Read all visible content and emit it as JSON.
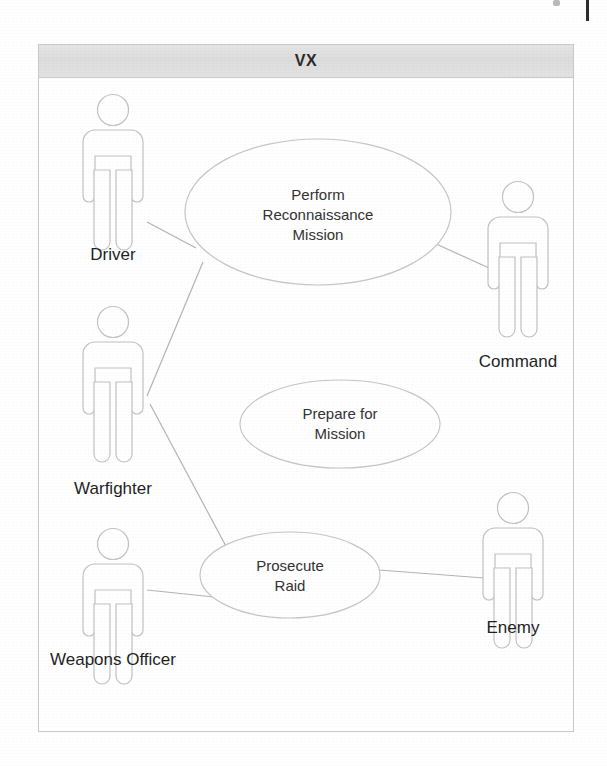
{
  "diagram": {
    "type": "uml-use-case-diagram",
    "system_boundary": {
      "title": "VX",
      "x": 38,
      "y": 44,
      "width": 536,
      "height": 688
    },
    "colors": {
      "stroke": "#bfbfbf",
      "actor_stroke": "#c4c4c4",
      "text": "#1f1f1f",
      "title_bar": "#e0e0e0",
      "boundary_border": "#c9c9c9",
      "background": "#ffffff"
    },
    "use_cases": [
      {
        "id": "perform-reconnaissance-mission",
        "label": "Perform\nReconnaissance\nMission",
        "cx": 318,
        "cy": 212,
        "rx": 133,
        "ry": 73
      },
      {
        "id": "prepare-for-mission",
        "label": "Prepare for\nMission",
        "cx": 340,
        "cy": 424,
        "rx": 100,
        "ry": 44
      },
      {
        "id": "prosecute-raid",
        "label": "Prosecute\nRaid",
        "cx": 290,
        "cy": 575,
        "rx": 90,
        "ry": 43
      }
    ],
    "actors": [
      {
        "id": "driver",
        "label": "Driver",
        "x": 113,
        "y": 100,
        "label_x": 113,
        "label_y": 245
      },
      {
        "id": "warfighter",
        "label": "Warfighter",
        "x": 113,
        "y": 312,
        "label_x": 113,
        "label_y": 479
      },
      {
        "id": "weapons-officer",
        "label": "Weapons Officer",
        "x": 113,
        "y": 534,
        "label_x": 113,
        "label_y": 650
      },
      {
        "id": "command",
        "label": "Command",
        "x": 518,
        "y": 187,
        "label_x": 518,
        "label_y": 352
      },
      {
        "id": "enemy",
        "label": "Enemy",
        "x": 513,
        "y": 498,
        "label_x": 513,
        "label_y": 618
      }
    ],
    "associations": [
      {
        "id": "driver-to-recon",
        "from": "driver",
        "to": "perform-reconnaissance-mission"
      },
      {
        "id": "warfighter-to-recon",
        "from": "warfighter",
        "to": "perform-reconnaissance-mission"
      },
      {
        "id": "command-to-recon",
        "from": "command",
        "to": "perform-reconnaissance-mission"
      },
      {
        "id": "warfighter-to-raid",
        "from": "warfighter",
        "to": "prosecute-raid"
      },
      {
        "id": "weapons-officer-to-raid",
        "from": "weapons-officer",
        "to": "prosecute-raid"
      },
      {
        "id": "enemy-to-raid",
        "from": "enemy",
        "to": "prosecute-raid"
      }
    ]
  }
}
